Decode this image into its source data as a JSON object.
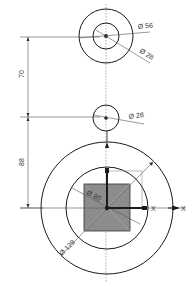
{
  "drawing": {
    "colors": {
      "line": "#1a1a1a",
      "thin": "#555555",
      "square_fill": "#8c8c8c",
      "background": "#ffffff"
    },
    "top_circle": {
      "outer_label": "Ø 56",
      "inner_label": "Ø 28"
    },
    "middle_circle": {
      "label": "Ø 28"
    },
    "bottom_circle": {
      "outer_label": "Ø 128",
      "inner_label": "Ø 80"
    },
    "dimensions": {
      "upper_vertical": "70",
      "lower_vertical": "88"
    },
    "axes": {
      "x_label_outer": "X",
      "x_label_inner": "X"
    }
  }
}
